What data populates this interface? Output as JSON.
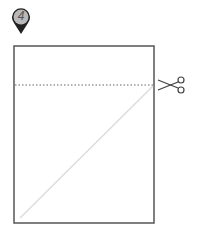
{
  "step": {
    "number": "4"
  },
  "diagram": {
    "paper": {
      "x": 14,
      "y": 46,
      "width": 140,
      "height": 177,
      "stroke": "#555555"
    },
    "cut_line": {
      "y": 85,
      "style": "dotted",
      "color": "#555555"
    },
    "fold_line": {
      "x1": 20,
      "y1": 218,
      "x2": 153,
      "y2": 86,
      "color": "#dddddd"
    },
    "icon": "scissors-icon"
  }
}
